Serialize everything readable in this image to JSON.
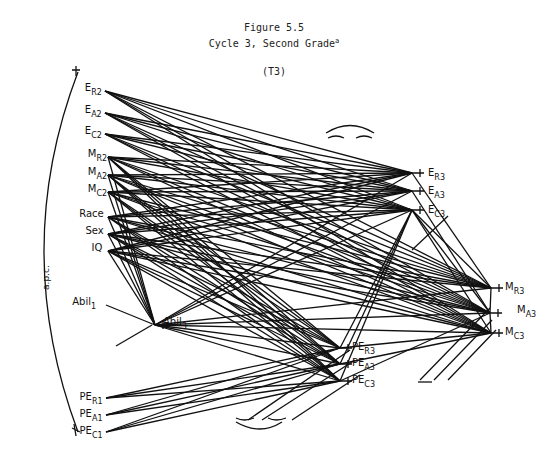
{
  "figure": {
    "number": "Figure 5.5",
    "title": "Cycle 3, Second Grade",
    "title_sup": "a",
    "subtitle": "(T3)",
    "side_label": "a.p.c."
  },
  "nodes": [
    {
      "id": "ER2",
      "main": "E",
      "sub": "R2",
      "x": 87,
      "y": 91,
      "ax": 105,
      "ay": 91
    },
    {
      "id": "EA2",
      "main": "E",
      "sub": "A2",
      "x": 87,
      "y": 113,
      "ax": 105,
      "ay": 113
    },
    {
      "id": "EC2",
      "main": "E",
      "sub": "C2",
      "x": 87,
      "y": 134,
      "ax": 105,
      "ay": 134
    },
    {
      "id": "MR2",
      "main": "M",
      "sub": "R2",
      "x": 87,
      "y": 157,
      "ax": 108,
      "ay": 157
    },
    {
      "id": "MA2",
      "main": "M",
      "sub": "A2",
      "x": 87,
      "y": 175,
      "ax": 108,
      "ay": 175
    },
    {
      "id": "MC2",
      "main": "M",
      "sub": "C2",
      "x": 87,
      "y": 192,
      "ax": 108,
      "ay": 192
    },
    {
      "id": "Race",
      "main": "Race",
      "sub": "",
      "x": 83,
      "y": 217,
      "ax": 108,
      "ay": 217
    },
    {
      "id": "Sex",
      "main": "Sex",
      "sub": "",
      "x": 89,
      "y": 234,
      "ax": 108,
      "ay": 234
    },
    {
      "id": "IQ",
      "main": "IQ",
      "sub": "",
      "x": 95,
      "y": 251,
      "ax": 108,
      "ay": 251
    },
    {
      "id": "Abil1",
      "main": "Abil",
      "sub": "1",
      "x": 78,
      "y": 305,
      "ax": 106,
      "ay": 305
    },
    {
      "id": "Abil3",
      "main": "Abil",
      "sub": "3",
      "x": 163,
      "y": 325,
      "ax": 155,
      "ay": 325
    },
    {
      "id": "PER1",
      "main": "PE",
      "sub": "R1",
      "x": 85,
      "y": 400,
      "ax": 106,
      "ay": 398
    },
    {
      "id": "PEA1",
      "main": "PE",
      "sub": "A1",
      "x": 85,
      "y": 417,
      "ax": 106,
      "ay": 415
    },
    {
      "id": "PEC1",
      "main": "PE",
      "sub": "C1",
      "x": 85,
      "y": 434,
      "ax": 106,
      "ay": 432
    },
    {
      "id": "ER3",
      "main": "E",
      "sub": "R3",
      "x": 428,
      "y": 176,
      "ax": 412,
      "ay": 173
    },
    {
      "id": "EA3",
      "main": "E",
      "sub": "A3",
      "x": 428,
      "y": 194,
      "ax": 412,
      "ay": 191
    },
    {
      "id": "EC3",
      "main": "E",
      "sub": "C3",
      "x": 428,
      "y": 213,
      "ax": 412,
      "ay": 210
    },
    {
      "id": "MR3",
      "main": "M",
      "sub": "R3",
      "x": 505,
      "y": 290,
      "ax": 491,
      "ay": 288
    },
    {
      "id": "MA3",
      "main": "M",
      "sub": "A3",
      "x": 517,
      "y": 313,
      "ax": 490,
      "ay": 313
    },
    {
      "id": "MC3",
      "main": "M",
      "sub": "C3",
      "x": 505,
      "y": 335,
      "ax": 491,
      "ay": 333
    },
    {
      "id": "PER3",
      "main": "PE",
      "sub": "R3",
      "x": 352,
      "y": 350,
      "ax": 340,
      "ay": 348
    },
    {
      "id": "PEA3",
      "main": "PE",
      "sub": "A3",
      "x": 352,
      "y": 366,
      "ax": 340,
      "ay": 364
    },
    {
      "id": "PEC3",
      "main": "PE",
      "sub": "C3",
      "x": 352,
      "y": 383,
      "ax": 340,
      "ay": 381
    }
  ],
  "edges": {
    "sources_to_E3": [
      "ER2",
      "EA2",
      "EC2",
      "MR2",
      "MA2",
      "MC2",
      "Race",
      "Sex",
      "IQ",
      "Abil3"
    ],
    "sources_to_M3": [
      "ER2",
      "EA2",
      "EC2",
      "MR2",
      "MA2",
      "MC2",
      "Race",
      "Sex",
      "IQ",
      "Abil3"
    ],
    "sources_to_PE3": [
      "MR2",
      "MA2",
      "MC2",
      "Race",
      "Sex",
      "IQ",
      "Abil3",
      "PER1",
      "PEA1",
      "PEC1"
    ],
    "sources_to_Abil3": [
      "MR2",
      "MA2",
      "MC2",
      "Race",
      "Sex",
      "IQ",
      "Abil1"
    ],
    "E3_targets": [
      "ER3",
      "EA3",
      "EC3"
    ],
    "M3_targets": [
      "MR3",
      "MA3",
      "MC3"
    ],
    "PE3_targets": [
      "PER3",
      "PEA3",
      "PEC3"
    ],
    "extra": [
      [
        "EC3",
        "MR3"
      ],
      [
        "EC3",
        "MA3"
      ],
      [
        "EC3",
        "MC3"
      ],
      [
        "ER3",
        "MR3"
      ],
      [
        "EA3",
        "MA3"
      ],
      [
        "PER3",
        "MC3"
      ],
      [
        "PEA3",
        "MC3"
      ],
      [
        "PEC3",
        "MA3"
      ],
      [
        "PER3",
        "EC3"
      ],
      [
        "PEA3",
        "EC3"
      ],
      [
        "PEC3",
        "EC3"
      ],
      [
        "MR3",
        "MA3"
      ],
      [
        "MC3",
        "MA3"
      ]
    ]
  },
  "colors": {
    "ink": "#111111",
    "paper": "#ffffff"
  }
}
